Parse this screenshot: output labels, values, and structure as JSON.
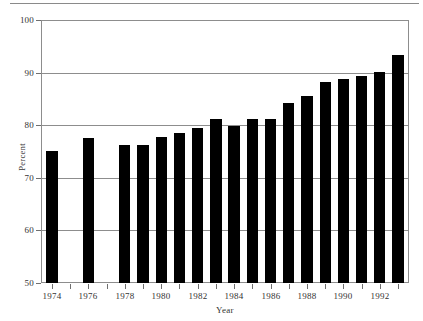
{
  "figure": {
    "background_color": "#ffffff",
    "bar_color": "#000000",
    "axis_color": "#8d8d8d",
    "text_color": "#333333"
  },
  "chart_data": {
    "type": "bar",
    "title": "",
    "subtitle": "",
    "xlabel": "Year",
    "ylabel": "Percent",
    "xlim": [
      1973.4,
      1993.6
    ],
    "ylim": [
      50,
      100
    ],
    "grid": true,
    "legend": null,
    "legend_position": "none",
    "y_ticks": [
      50,
      60,
      70,
      80,
      90,
      100
    ],
    "y_tick_labels": [
      "50",
      "60",
      "70",
      "80",
      "90",
      "100"
    ],
    "x_ticks": [
      1974,
      1975,
      1976,
      1977,
      1978,
      1979,
      1980,
      1981,
      1982,
      1983,
      1984,
      1985,
      1986,
      1987,
      1988,
      1989,
      1990,
      1991,
      1992,
      1993
    ],
    "x_tick_labels": [
      "1974",
      "",
      "1976",
      "",
      "1978",
      "",
      "1980",
      "",
      "1982",
      "",
      "1984",
      "",
      "1986",
      "",
      "1988",
      "",
      "1990",
      "",
      "1992",
      ""
    ],
    "x_labeled_ticks": [
      1974,
      1976,
      1978,
      1980,
      1982,
      1984,
      1986,
      1988,
      1990,
      1992
    ],
    "categories": [
      1974,
      1975,
      1976,
      1977,
      1978,
      1979,
      1980,
      1981,
      1982,
      1983,
      1984,
      1985,
      1986,
      1987,
      1988,
      1989,
      1990,
      1991,
      1992,
      1993
    ],
    "values": [
      75.1,
      null,
      77.5,
      null,
      76.2,
      76.2,
      77.8,
      78.6,
      79.4,
      81.1,
      79.8,
      81.1,
      81.1,
      84.2,
      85.6,
      88.2,
      88.8,
      89.3,
      90.2,
      93.3
    ],
    "missing_categories": [
      1975,
      1977
    ],
    "annotations": []
  }
}
